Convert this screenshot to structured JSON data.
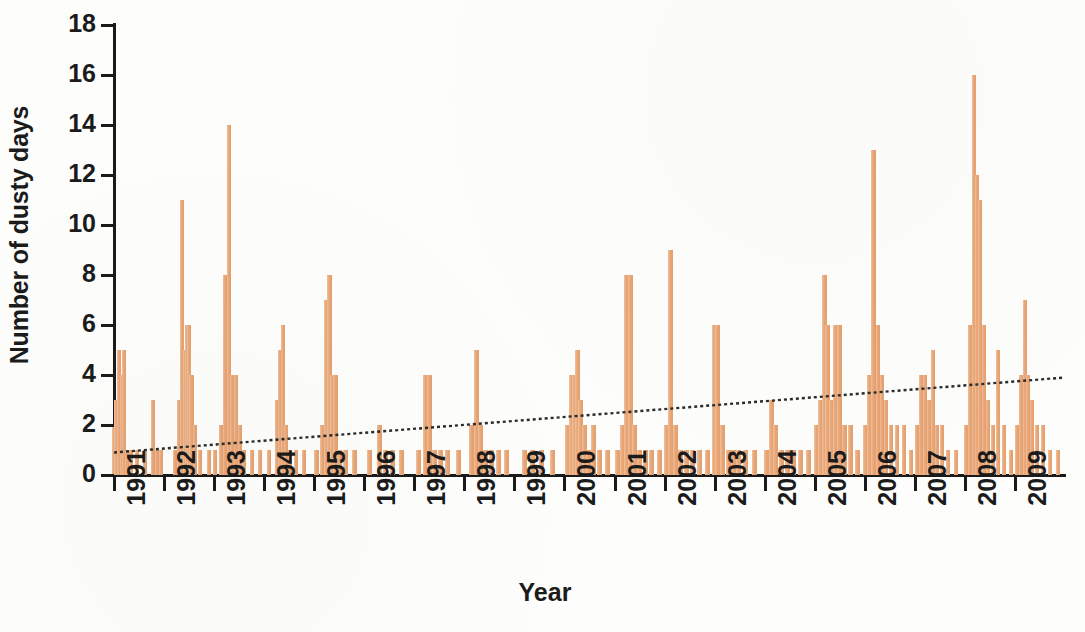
{
  "chart_data": {
    "type": "bar",
    "title": "",
    "xlabel": "Year",
    "ylabel": "Number of dusty days",
    "ylim": [
      0,
      18
    ],
    "ytick_labels": [
      "0",
      "2",
      "4",
      "6",
      "8",
      "10",
      "12",
      "14",
      "16",
      "18"
    ],
    "ytick_values": [
      0,
      2,
      4,
      6,
      8,
      10,
      12,
      14,
      16,
      18
    ],
    "xtick_labels": [
      "1991",
      "1992",
      "1993",
      "1994",
      "1995",
      "1996",
      "1997",
      "1998",
      "1999",
      "2000",
      "2001",
      "2002",
      "2003",
      "2004",
      "2005",
      "2006",
      "2007",
      "2008",
      "2009"
    ],
    "xlim": [
      1991,
      2010
    ],
    "grid": false,
    "legend": null,
    "bar_color": "#e8a473",
    "axis_color": "#1a1a1a",
    "trend_color": "#2b2b2b",
    "trend_style": "dotted",
    "series_name": "Monthly dusty days",
    "x_unit": "month",
    "note": "Monthly counts of dusty days, Jan 1991 through Dec 2009; dotted line is the linear trend.",
    "trendline": {
      "x_start": 1991.0,
      "y_start": 0.9,
      "x_end": 2010.0,
      "y_end": 3.9
    },
    "values": [
      2,
      3,
      5,
      4,
      5,
      1,
      1,
      0,
      0,
      0,
      0,
      0,
      3,
      1,
      1,
      0,
      0,
      0,
      0,
      0,
      0,
      0,
      0,
      0,
      0,
      1,
      3,
      11,
      5,
      6,
      6,
      4,
      1,
      0,
      0,
      0,
      1,
      1,
      2,
      8,
      14,
      4,
      2,
      2,
      1,
      1,
      1,
      0,
      1,
      0,
      0,
      1,
      1,
      1,
      0,
      0,
      0,
      0,
      0,
      0,
      0,
      1,
      1,
      3,
      6,
      5,
      2,
      1,
      1,
      1,
      0,
      0,
      0,
      0,
      1,
      2,
      2,
      7,
      8,
      4,
      4,
      1,
      1,
      0,
      0,
      0,
      0,
      1,
      1,
      1,
      1,
      0,
      0,
      0,
      0,
      0,
      0,
      0,
      2,
      1,
      1,
      0,
      0,
      0,
      0,
      0,
      0,
      0,
      0,
      0,
      1,
      4,
      4,
      1,
      1,
      1,
      0,
      0,
      0,
      0,
      0,
      0,
      0,
      1,
      2,
      5,
      1,
      1,
      1,
      0,
      1,
      1,
      1,
      1,
      1,
      2,
      4,
      5,
      4,
      2,
      1,
      1,
      1,
      0,
      0,
      1,
      1,
      3,
      8,
      9,
      1,
      1,
      1,
      1,
      1,
      0,
      0,
      1,
      1,
      1,
      6,
      6,
      2,
      1,
      1,
      1,
      1,
      0,
      1,
      1,
      1,
      1,
      1,
      1,
      1,
      1,
      0,
      0,
      0,
      0,
      0,
      1,
      1,
      1,
      2,
      1,
      1,
      1,
      1,
      1,
      0,
      0,
      1,
      2,
      4,
      8,
      6,
      5,
      2,
      2,
      1,
      1,
      0,
      0,
      1,
      1,
      2,
      6,
      6,
      4,
      3,
      2,
      2,
      1,
      1,
      0,
      1,
      2,
      5,
      13,
      6,
      4,
      3,
      2,
      2,
      2,
      1,
      1,
      1,
      2,
      4,
      4,
      3,
      2,
      2,
      1,
      1,
      1,
      1,
      0,
      1,
      2,
      6,
      16,
      12,
      11,
      6,
      3,
      2,
      2,
      1,
      1,
      1,
      2,
      3,
      5,
      4,
      3,
      2,
      2,
      1,
      1,
      1,
      0,
      1,
      2,
      4,
      7,
      17,
      6,
      3,
      2,
      2,
      1,
      1,
      0,
      1,
      2,
      3,
      4,
      3,
      2,
      2,
      1,
      1,
      1,
      1,
      0,
      1,
      3,
      6,
      17,
      7,
      5,
      3,
      2,
      2,
      1,
      1,
      0,
      1,
      2,
      8,
      8,
      6,
      4,
      3,
      2,
      2,
      1,
      1,
      0,
      1,
      2,
      5,
      7,
      7,
      5,
      3,
      2,
      2,
      1,
      1,
      1
    ],
    "bars": [
      {
        "x": 1991.0,
        "y": 2
      },
      {
        "x": 1991.05,
        "y": 3
      },
      {
        "x": 1991.1,
        "y": 5
      },
      {
        "x": 1991.16,
        "y": 4
      },
      {
        "x": 1991.2,
        "y": 5
      },
      {
        "x": 1991.26,
        "y": 1
      },
      {
        "x": 1991.34,
        "y": 1
      },
      {
        "x": 1991.46,
        "y": 1
      },
      {
        "x": 1991.62,
        "y": 1
      },
      {
        "x": 1991.78,
        "y": 3
      },
      {
        "x": 1991.86,
        "y": 1
      },
      {
        "x": 1991.94,
        "y": 1
      },
      {
        "x": 1992.22,
        "y": 1
      },
      {
        "x": 1992.3,
        "y": 3
      },
      {
        "x": 1992.36,
        "y": 11
      },
      {
        "x": 1992.42,
        "y": 5
      },
      {
        "x": 1992.46,
        "y": 6
      },
      {
        "x": 1992.5,
        "y": 6
      },
      {
        "x": 1992.55,
        "y": 4
      },
      {
        "x": 1992.62,
        "y": 2
      },
      {
        "x": 1992.72,
        "y": 1
      },
      {
        "x": 1992.9,
        "y": 1
      },
      {
        "x": 1993.02,
        "y": 1
      },
      {
        "x": 1993.14,
        "y": 2
      },
      {
        "x": 1993.22,
        "y": 8
      },
      {
        "x": 1993.3,
        "y": 14
      },
      {
        "x": 1993.36,
        "y": 4
      },
      {
        "x": 1993.44,
        "y": 4
      },
      {
        "x": 1993.52,
        "y": 2
      },
      {
        "x": 1993.6,
        "y": 1
      },
      {
        "x": 1993.76,
        "y": 1
      },
      {
        "x": 1993.92,
        "y": 1
      },
      {
        "x": 1994.1,
        "y": 1
      },
      {
        "x": 1994.26,
        "y": 3
      },
      {
        "x": 1994.32,
        "y": 5
      },
      {
        "x": 1994.38,
        "y": 6
      },
      {
        "x": 1994.44,
        "y": 2
      },
      {
        "x": 1994.52,
        "y": 1
      },
      {
        "x": 1994.64,
        "y": 1
      },
      {
        "x": 1994.8,
        "y": 1
      },
      {
        "x": 1995.04,
        "y": 1
      },
      {
        "x": 1995.16,
        "y": 2
      },
      {
        "x": 1995.24,
        "y": 7
      },
      {
        "x": 1995.3,
        "y": 8
      },
      {
        "x": 1995.36,
        "y": 4
      },
      {
        "x": 1995.42,
        "y": 4
      },
      {
        "x": 1995.5,
        "y": 1
      },
      {
        "x": 1995.62,
        "y": 1
      },
      {
        "x": 1995.8,
        "y": 1
      },
      {
        "x": 1996.1,
        "y": 1
      },
      {
        "x": 1996.3,
        "y": 2
      },
      {
        "x": 1996.42,
        "y": 1
      },
      {
        "x": 1996.56,
        "y": 1
      },
      {
        "x": 1996.74,
        "y": 1
      },
      {
        "x": 1997.08,
        "y": 1
      },
      {
        "x": 1997.22,
        "y": 4
      },
      {
        "x": 1997.3,
        "y": 4
      },
      {
        "x": 1997.4,
        "y": 1
      },
      {
        "x": 1997.52,
        "y": 1
      },
      {
        "x": 1997.66,
        "y": 1
      },
      {
        "x": 1997.88,
        "y": 1
      },
      {
        "x": 1998.14,
        "y": 2
      },
      {
        "x": 1998.24,
        "y": 5
      },
      {
        "x": 1998.32,
        "y": 2
      },
      {
        "x": 1998.42,
        "y": 1
      },
      {
        "x": 1998.54,
        "y": 1
      },
      {
        "x": 1998.68,
        "y": 1
      },
      {
        "x": 1998.84,
        "y": 1
      },
      {
        "x": 1999.2,
        "y": 1
      },
      {
        "x": 1999.36,
        "y": 1
      },
      {
        "x": 1999.54,
        "y": 1
      },
      {
        "x": 1999.76,
        "y": 1
      },
      {
        "x": 2000.06,
        "y": 2
      },
      {
        "x": 2000.14,
        "y": 4
      },
      {
        "x": 2000.2,
        "y": 4
      },
      {
        "x": 2000.26,
        "y": 5
      },
      {
        "x": 2000.32,
        "y": 3
      },
      {
        "x": 2000.4,
        "y": 2
      },
      {
        "x": 2000.48,
        "y": 1
      },
      {
        "x": 2000.58,
        "y": 2
      },
      {
        "x": 2000.7,
        "y": 1
      },
      {
        "x": 2000.86,
        "y": 1
      },
      {
        "x": 2001.06,
        "y": 1
      },
      {
        "x": 2001.16,
        "y": 2
      },
      {
        "x": 2001.24,
        "y": 8
      },
      {
        "x": 2001.32,
        "y": 8
      },
      {
        "x": 2001.4,
        "y": 2
      },
      {
        "x": 2001.5,
        "y": 1
      },
      {
        "x": 2001.62,
        "y": 1
      },
      {
        "x": 2001.74,
        "y": 1
      },
      {
        "x": 2001.9,
        "y": 1
      },
      {
        "x": 2002.04,
        "y": 2
      },
      {
        "x": 2002.12,
        "y": 9
      },
      {
        "x": 2002.22,
        "y": 2
      },
      {
        "x": 2002.32,
        "y": 1
      },
      {
        "x": 2002.44,
        "y": 1
      },
      {
        "x": 2002.56,
        "y": 1
      },
      {
        "x": 2002.7,
        "y": 1
      },
      {
        "x": 2002.86,
        "y": 1
      },
      {
        "x": 2003.0,
        "y": 6
      },
      {
        "x": 2003.06,
        "y": 6
      },
      {
        "x": 2003.16,
        "y": 2
      },
      {
        "x": 2003.28,
        "y": 1
      },
      {
        "x": 2003.38,
        "y": 1
      },
      {
        "x": 2003.48,
        "y": 1
      },
      {
        "x": 2003.62,
        "y": 1
      },
      {
        "x": 2003.8,
        "y": 1
      },
      {
        "x": 2004.04,
        "y": 1
      },
      {
        "x": 2004.14,
        "y": 3
      },
      {
        "x": 2004.22,
        "y": 2
      },
      {
        "x": 2004.34,
        "y": 1
      },
      {
        "x": 2004.46,
        "y": 1
      },
      {
        "x": 2004.58,
        "y": 1
      },
      {
        "x": 2004.72,
        "y": 1
      },
      {
        "x": 2004.88,
        "y": 1
      },
      {
        "x": 2005.04,
        "y": 2
      },
      {
        "x": 2005.12,
        "y": 3
      },
      {
        "x": 2005.2,
        "y": 8
      },
      {
        "x": 2005.26,
        "y": 6
      },
      {
        "x": 2005.34,
        "y": 3
      },
      {
        "x": 2005.42,
        "y": 6
      },
      {
        "x": 2005.5,
        "y": 6
      },
      {
        "x": 2005.6,
        "y": 2
      },
      {
        "x": 2005.72,
        "y": 2
      },
      {
        "x": 2005.86,
        "y": 1
      },
      {
        "x": 2006.02,
        "y": 2
      },
      {
        "x": 2006.1,
        "y": 4
      },
      {
        "x": 2006.18,
        "y": 13
      },
      {
        "x": 2006.26,
        "y": 6
      },
      {
        "x": 2006.34,
        "y": 4
      },
      {
        "x": 2006.42,
        "y": 3
      },
      {
        "x": 2006.52,
        "y": 2
      },
      {
        "x": 2006.64,
        "y": 2
      },
      {
        "x": 2006.78,
        "y": 2
      },
      {
        "x": 2006.92,
        "y": 1
      },
      {
        "x": 2007.04,
        "y": 2
      },
      {
        "x": 2007.12,
        "y": 4
      },
      {
        "x": 2007.2,
        "y": 4
      },
      {
        "x": 2007.28,
        "y": 3
      },
      {
        "x": 2007.36,
        "y": 5
      },
      {
        "x": 2007.44,
        "y": 2
      },
      {
        "x": 2007.54,
        "y": 2
      },
      {
        "x": 2007.66,
        "y": 1
      },
      {
        "x": 2007.82,
        "y": 1
      },
      {
        "x": 2008.02,
        "y": 2
      },
      {
        "x": 2008.1,
        "y": 6
      },
      {
        "x": 2008.18,
        "y": 16
      },
      {
        "x": 2008.24,
        "y": 12
      },
      {
        "x": 2008.3,
        "y": 11
      },
      {
        "x": 2008.38,
        "y": 6
      },
      {
        "x": 2008.46,
        "y": 3
      },
      {
        "x": 2008.56,
        "y": 2
      },
      {
        "x": 2008.66,
        "y": 5
      },
      {
        "x": 2008.78,
        "y": 2
      },
      {
        "x": 2008.92,
        "y": 1
      },
      {
        "x": 2009.04,
        "y": 2
      },
      {
        "x": 2009.12,
        "y": 4
      },
      {
        "x": 2009.2,
        "y": 7
      },
      {
        "x": 2009.26,
        "y": 4
      },
      {
        "x": 2009.34,
        "y": 3
      },
      {
        "x": 2009.44,
        "y": 2
      },
      {
        "x": 2009.56,
        "y": 2
      },
      {
        "x": 2009.7,
        "y": 1
      },
      {
        "x": 2009.86,
        "y": 1
      }
    ]
  },
  "chart": {
    "xlabel": "Year",
    "ylabel": "Number of dusty days"
  }
}
